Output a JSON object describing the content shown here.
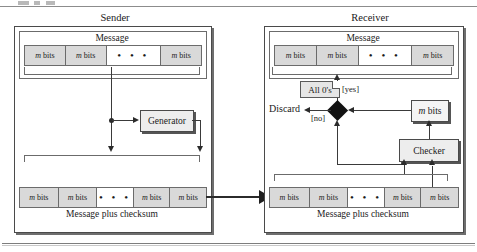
{
  "figure": {
    "sender": {
      "title": "Sender",
      "message_label": "Message",
      "message_cells": [
        "m bits",
        "m bits",
        "dots",
        "m bits"
      ],
      "checksum_label": "Message plus checksum",
      "checksum_cells": [
        "m bits",
        "m bits",
        "dots",
        "m bits",
        "m bits"
      ],
      "generator_label": "Generator"
    },
    "receiver": {
      "title": "Receiver",
      "message_label": "Message",
      "message_cells": [
        "m bits",
        "m bits",
        "dots",
        "m bits"
      ],
      "checksum_label": "Message plus checksum",
      "checksum_cells": [
        "m bits",
        "m bits",
        "dots",
        "m bits",
        "m bits"
      ],
      "checker_label": "Checker",
      "mbits_box_label": "m bits",
      "note_label": "All 0's",
      "yes_label": "[yes]",
      "no_label": "[no]",
      "discard_label": "Discard"
    },
    "dots_glyph": "• • •",
    "colors": {
      "cell_fill": "#d9d9d9",
      "box_fill": "#ededed",
      "note_fill": "#e6e6e6",
      "line": "#3a3a3a",
      "diamond": "#121212",
      "panel_border": "#4a4a4a"
    }
  }
}
